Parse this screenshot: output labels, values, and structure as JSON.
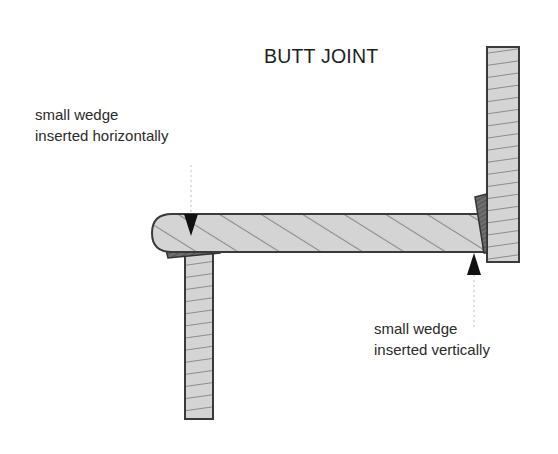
{
  "diagram": {
    "title": "BUTT JOINT",
    "annotations": [
      {
        "line1": "small wedge",
        "line2": "inserted horizontally",
        "target": "wedge under rail at left post"
      },
      {
        "line1": "small wedge",
        "line2": "inserted vertically",
        "target": "wedge between rail end and right post"
      }
    ],
    "parts": [
      "horizontal rail",
      "left vertical post",
      "right vertical post",
      "horizontal wedge",
      "vertical wedge"
    ],
    "colors": {
      "wood_fill": "#d4d4d4",
      "grain": "#8c8c8c",
      "outline": "#3a3a3a",
      "wedge_fill": "#6e6e6e",
      "arrow": "#111111",
      "leader": "#bdbdbd"
    }
  }
}
